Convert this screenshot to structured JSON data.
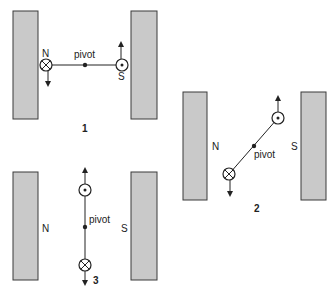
{
  "figure": {
    "diagrams": [
      {
        "number": "1",
        "left_pole": "N",
        "right_pole": "S",
        "pivot_label": "pivot",
        "left_coil": "cross-into-page",
        "right_coil": "dot-out-of-page",
        "left_force": "down",
        "right_force": "up"
      },
      {
        "number": "2",
        "left_pole": "N",
        "right_pole": "S",
        "pivot_label": "pivot",
        "upper_coil": "dot-out-of-page",
        "lower_coil": "cross-into-page",
        "upper_force": "up",
        "lower_force": "down"
      },
      {
        "number": "3",
        "left_pole": "N",
        "right_pole": "S",
        "pivot_label": "pivot",
        "upper_coil": "dot-out-of-page",
        "lower_coil": "cross-into-page",
        "upper_force": "up",
        "lower_force": "down"
      }
    ],
    "colors": {
      "magnet_fill": "#c9c9c9",
      "stroke": "#222222"
    }
  }
}
